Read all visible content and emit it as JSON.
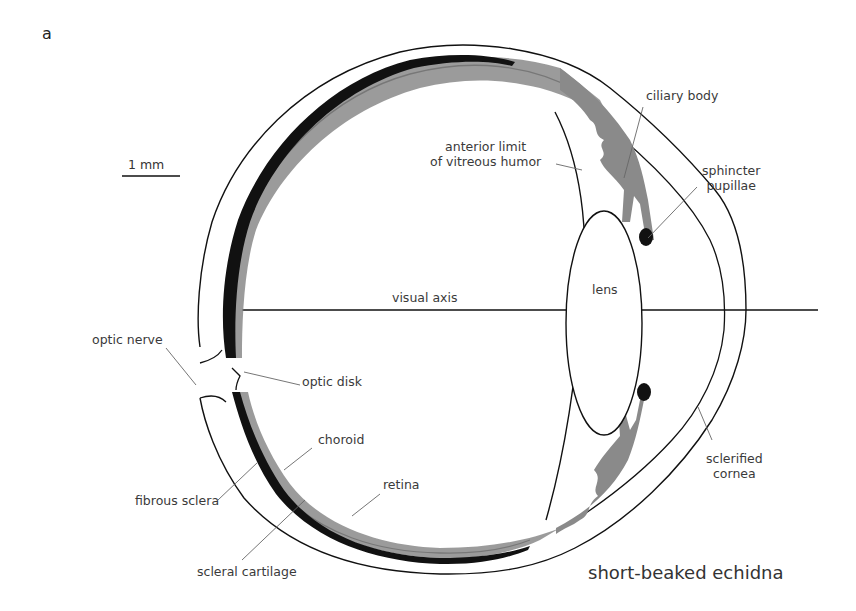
{
  "figure": {
    "panel_letter": "a",
    "species": "short-beaked echidna",
    "scale_bar": "1 mm",
    "labels": {
      "ciliary_body": "ciliary body",
      "anterior_limit_1": "anterior limit",
      "anterior_limit_2": "of vitreous humor",
      "sphincter_1": "sphincter",
      "sphincter_2": "pupillae",
      "visual_axis": "visual axis",
      "lens": "lens",
      "optic_nerve": "optic nerve",
      "optic_disk": "optic disk",
      "choroid": "choroid",
      "fibrous_sclera": "fibrous sclera",
      "retina": "retina",
      "scleral_cartilage": "scleral cartilage",
      "sclerified_1": "sclerified",
      "sclerified_2": "cornea"
    },
    "colors": {
      "line": "#111111",
      "choroid_gray": "#8a8a8a",
      "cartilage_black": "#111111",
      "leader": "#555555",
      "text": "#3a3a3a"
    }
  }
}
